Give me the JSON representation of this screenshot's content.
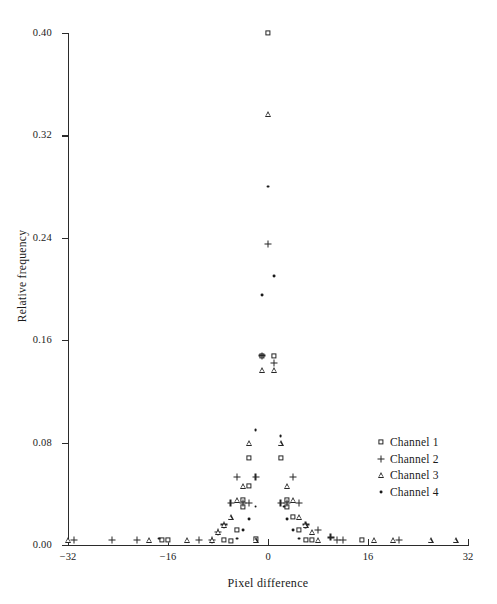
{
  "chart_data": {
    "type": "scatter",
    "title": "",
    "xlabel": "Pixel difference",
    "ylabel": "Relative frequency",
    "xlim": [
      -32,
      32
    ],
    "ylim": [
      0.0,
      0.4
    ],
    "xticks": [
      -32,
      -16,
      0,
      16,
      32
    ],
    "xtick_labels": [
      "−32",
      "−16",
      "0",
      "16",
      "32"
    ],
    "yticks": [
      0.0,
      0.08,
      0.16,
      0.24,
      0.32,
      0.4
    ],
    "ytick_labels": [
      "0.00",
      "0.08",
      "0.16",
      "0.24",
      "0.32",
      "0.40"
    ],
    "grid": false,
    "legend_position": "center-right",
    "series": [
      {
        "name": "Channel 1",
        "marker": "square",
        "points": [
          [
            -17.0,
            0.004
          ],
          [
            -16.0,
            0.004
          ],
          [
            -7.0,
            0.004
          ],
          [
            -6.0,
            0.003
          ],
          [
            -5.0,
            0.012
          ],
          [
            -4.0,
            0.03
          ],
          [
            -4.0,
            0.035
          ],
          [
            -3.0,
            0.046
          ],
          [
            -3.0,
            0.068
          ],
          [
            -2.0,
            0.005
          ],
          [
            -1.0,
            0.148
          ],
          [
            0.0,
            0.4
          ],
          [
            1.0,
            0.148
          ],
          [
            2.0,
            0.068
          ],
          [
            3.0,
            0.035
          ],
          [
            3.0,
            0.03
          ],
          [
            4.0,
            0.022
          ],
          [
            5.0,
            0.012
          ],
          [
            6.0,
            0.004
          ],
          [
            7.0,
            0.004
          ],
          [
            15.0,
            0.004
          ]
        ]
      },
      {
        "name": "Channel 2",
        "marker": "plus",
        "points": [
          [
            -31.0,
            0.004
          ],
          [
            -25.0,
            0.004
          ],
          [
            -21.0,
            0.004
          ],
          [
            -11.0,
            0.004
          ],
          [
            -9.0,
            0.004
          ],
          [
            -8.0,
            0.01
          ],
          [
            -7.0,
            0.016
          ],
          [
            -6.0,
            0.033
          ],
          [
            -5.0,
            0.053
          ],
          [
            -4.0,
            0.033
          ],
          [
            -3.0,
            0.033
          ],
          [
            -2.0,
            0.053
          ],
          [
            -1.0,
            0.148
          ],
          [
            0.0,
            0.235
          ],
          [
            1.0,
            0.142
          ],
          [
            2.0,
            0.033
          ],
          [
            3.0,
            0.033
          ],
          [
            4.0,
            0.053
          ],
          [
            5.0,
            0.033
          ],
          [
            6.0,
            0.016
          ],
          [
            8.0,
            0.012
          ],
          [
            10.0,
            0.006
          ],
          [
            11.0,
            0.004
          ],
          [
            12.0,
            0.004
          ],
          [
            21.0,
            0.004
          ]
        ]
      },
      {
        "name": "Channel 3",
        "marker": "triangle",
        "points": [
          [
            -32.0,
            0.004
          ],
          [
            -19.0,
            0.004
          ],
          [
            -13.0,
            0.004
          ],
          [
            -9.0,
            0.004
          ],
          [
            -8.0,
            0.01
          ],
          [
            -7.0,
            0.016
          ],
          [
            -6.0,
            0.022
          ],
          [
            -5.0,
            0.035
          ],
          [
            -4.0,
            0.046
          ],
          [
            -3.0,
            0.08
          ],
          [
            -2.0,
            0.004
          ],
          [
            -1.0,
            0.137
          ],
          [
            0.0,
            0.337
          ],
          [
            1.0,
            0.137
          ],
          [
            2.0,
            0.08
          ],
          [
            3.0,
            0.046
          ],
          [
            4.0,
            0.035
          ],
          [
            5.0,
            0.022
          ],
          [
            6.0,
            0.016
          ],
          [
            7.0,
            0.01
          ],
          [
            8.0,
            0.004
          ],
          [
            17.0,
            0.004
          ],
          [
            20.0,
            0.004
          ],
          [
            26.0,
            0.004
          ],
          [
            30.0,
            0.004
          ]
        ]
      },
      {
        "name": "Channel 4",
        "marker": "dot",
        "points": [
          [
            -17.5,
            0.005
          ],
          [
            -5.0,
            0.005
          ],
          [
            -4.0,
            0.012
          ],
          [
            -3.0,
            0.02
          ],
          [
            -2.0,
            0.03
          ],
          [
            -2.0,
            0.09
          ],
          [
            -1.0,
            0.195
          ],
          [
            0.0,
            0.28
          ],
          [
            1.0,
            0.21
          ],
          [
            2.0,
            0.085
          ],
          [
            2.5,
            0.03
          ],
          [
            3.0,
            0.02
          ],
          [
            4.0,
            0.012
          ],
          [
            5.0,
            0.005
          ]
        ]
      }
    ]
  },
  "legend": {
    "items": [
      {
        "label": "Channel 1",
        "marker": "square"
      },
      {
        "label": "Channel 2",
        "marker": "plus"
      },
      {
        "label": "Channel 3",
        "marker": "triangle"
      },
      {
        "label": "Channel 4",
        "marker": "dot"
      }
    ]
  }
}
